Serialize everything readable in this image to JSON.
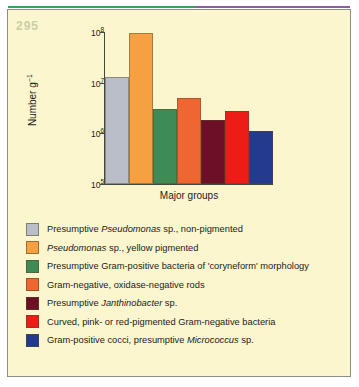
{
  "figure": {
    "number": "295",
    "panel_background": "#fbf6cd",
    "border_color": "#8c8f85"
  },
  "chart_data": {
    "type": "bar",
    "title": "",
    "xlabel": "Major groups",
    "ylabel": "Number g⁻¹",
    "yscale": "log",
    "ylim": [
      100000,
      100000000
    ],
    "ytick_values": [
      100000,
      1000000,
      10000000,
      100000000
    ],
    "ytick_labels": [
      "10⁵",
      "10⁶",
      "10⁷",
      "10⁸"
    ],
    "grid": false,
    "legend_position": "below",
    "categories": [
      "Presumptive Pseudomonas sp., non-pigmented",
      "Pseudomonas sp., yellow pigmented",
      "Presumptive Gram-positive bacteria of 'coryneform' morphology",
      "Gram-negative, oxidase-negative rods",
      "Presumptive Janthinobacter sp.",
      "Curved, pink- or red-pigmented Gram-negative bacteria",
      "Gram-positive cocci, presumptive Micrococcus sp."
    ],
    "values": [
      13000000,
      95000000,
      3000000,
      5000000,
      1800000,
      2800000,
      1100000
    ],
    "colors": [
      "#b9bec8",
      "#f5a142",
      "#3f8b55",
      "#ef6630",
      "#6d1026",
      "#ed1c16",
      "#243a8f"
    ]
  },
  "y_ticks": [
    {
      "label_base": "10",
      "label_exp": "8",
      "value": 100000000
    },
    {
      "label_base": "10",
      "label_exp": "7",
      "value": 10000000
    },
    {
      "label_base": "10",
      "label_exp": "6",
      "value": 1000000
    },
    {
      "label_base": "10",
      "label_exp": "5",
      "value": 100000
    }
  ],
  "axes": {
    "y_title_base": "Number g",
    "y_title_exp": "−1",
    "x_title": "Major groups"
  },
  "legend": {
    "items": [
      {
        "color": "#b9bec8",
        "prefix": "Presumptive ",
        "italic": "Pseudomonas",
        "suffix": " sp., non-pigmented"
      },
      {
        "color": "#f5a142",
        "prefix": "",
        "italic": "Pseudomonas",
        "suffix": " sp., yellow pigmented"
      },
      {
        "color": "#3f8b55",
        "prefix": "Presumptive Gram-positive bacteria of 'coryneform' morphology",
        "italic": "",
        "suffix": ""
      },
      {
        "color": "#ef6630",
        "prefix": "Gram-negative, oxidase-negative rods",
        "italic": "",
        "suffix": ""
      },
      {
        "color": "#6d1026",
        "prefix": "Presumptive ",
        "italic": "Janthinobacter",
        "suffix": " sp."
      },
      {
        "color": "#ed1c16",
        "prefix": "Curved, pink- or red-pigmented Gram-negative bacteria",
        "italic": "",
        "suffix": ""
      },
      {
        "color": "#243a8f",
        "prefix": "Gram-positive cocci, presumptive ",
        "italic": "Micrococcus",
        "suffix": " sp."
      }
    ]
  }
}
